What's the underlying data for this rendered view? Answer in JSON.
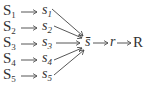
{
  "diagram": {
    "sources": [
      {
        "upper": "S",
        "lower": "s",
        "index": "1"
      },
      {
        "upper": "S",
        "lower": "s",
        "index": "2"
      },
      {
        "upper": "S",
        "lower": "s",
        "index": "3"
      },
      {
        "upper": "S",
        "lower": "s",
        "index": "4"
      },
      {
        "upper": "S",
        "lower": "s",
        "index": "5"
      }
    ],
    "arrow": "→",
    "aggregate": "s̄",
    "intermediate": "r",
    "result": "R"
  }
}
